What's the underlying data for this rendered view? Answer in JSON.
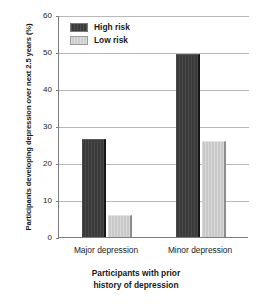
{
  "chart_data": {
    "type": "bar",
    "title": "",
    "xlabel": "Participants with prior history of depression",
    "xlabel_line1": "Participants with prior",
    "xlabel_line2": "history of depression",
    "ylabel": "Participants developing depression over next 2.5 years (%)",
    "categories": [
      "Major depression",
      "Minor depression"
    ],
    "series": [
      {
        "name": "High risk",
        "color": "#3b3b3b",
        "values": [
          26.5,
          49.5
        ]
      },
      {
        "name": "Low risk",
        "color": "#c9c9c9",
        "values": [
          6,
          26
        ]
      }
    ],
    "ylim": [
      0,
      60
    ],
    "ytick_values": [
      0,
      10,
      20,
      30,
      40,
      50,
      60
    ],
    "ytick_labels": [
      "0",
      "10",
      "20",
      "30",
      "40",
      "50",
      "60"
    ],
    "grid": true,
    "legend_position": "top-left"
  },
  "legend": {
    "items": [
      {
        "label": "High risk",
        "key": "high"
      },
      {
        "label": "Low risk",
        "key": "low"
      }
    ]
  }
}
